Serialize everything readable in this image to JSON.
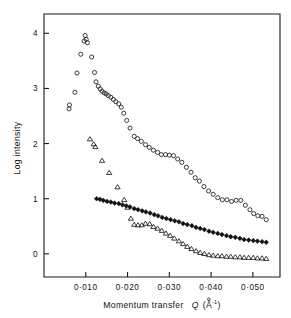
{
  "figure": {
    "background_color": "#ffffff",
    "ink_color": "#111111"
  },
  "chart_data": {
    "type": "scatter",
    "title": "",
    "subtitle": "",
    "xlabel": "Momentum transfer  Q (Å⁻¹)",
    "xlabel_main": "Momentum transfer",
    "xlabel_symbol": "Q",
    "xlabel_unit_open": "(Å",
    "xlabel_unit_exp": "-1",
    "xlabel_unit_close": ")",
    "ylabel": "Log intensity",
    "xlim": [
      0.0,
      0.0565
    ],
    "ylim": [
      -0.42,
      4.35
    ],
    "xticks": [
      0.01,
      0.02,
      0.03,
      0.04,
      0.05
    ],
    "xticklabels": [
      "0·010",
      "0·020",
      "0·030",
      "0·040",
      "0·050"
    ],
    "yticks": [
      0,
      1,
      2,
      3,
      4
    ],
    "yticklabels": [
      "0",
      "1",
      "2",
      "3",
      "4"
    ],
    "grid": false,
    "legend": "none",
    "frame": "full-box",
    "series": [
      {
        "name": "open-circles",
        "marker": "circle-open",
        "marker_size": 4.1,
        "points": [
          [
            0.006,
            2.63
          ],
          [
            0.0061,
            2.7
          ],
          [
            0.0074,
            2.93
          ],
          [
            0.0079,
            3.28
          ],
          [
            0.0088,
            3.62
          ],
          [
            0.0096,
            3.86
          ],
          [
            0.00985,
            3.96
          ],
          [
            0.0101,
            3.89
          ],
          [
            0.0104,
            3.83
          ],
          [
            0.0114,
            3.57
          ],
          [
            0.0121,
            3.29
          ],
          [
            0.01245,
            3.12
          ],
          [
            0.013,
            3.04
          ],
          [
            0.01345,
            2.99
          ],
          [
            0.0139,
            2.95
          ],
          [
            0.0144,
            2.92
          ],
          [
            0.0149,
            2.9
          ],
          [
            0.0154,
            2.87
          ],
          [
            0.016,
            2.84
          ],
          [
            0.0166,
            2.8
          ],
          [
            0.0172,
            2.76
          ],
          [
            0.0179,
            2.72
          ],
          [
            0.0185,
            2.66
          ],
          [
            0.0191,
            2.55
          ],
          [
            0.0198,
            2.42
          ],
          [
            0.0206,
            2.28
          ],
          [
            0.0216,
            2.13
          ],
          [
            0.0224,
            2.09
          ],
          [
            0.0233,
            2.04
          ],
          [
            0.0243,
            1.98
          ],
          [
            0.0252,
            1.93
          ],
          [
            0.0262,
            1.88
          ],
          [
            0.0272,
            1.84
          ],
          [
            0.0281,
            1.8
          ],
          [
            0.0291,
            1.8
          ],
          [
            0.03,
            1.79
          ],
          [
            0.031,
            1.78
          ],
          [
            0.032,
            1.72
          ],
          [
            0.033,
            1.66
          ],
          [
            0.0341,
            1.57
          ],
          [
            0.0352,
            1.48
          ],
          [
            0.0362,
            1.38
          ],
          [
            0.0372,
            1.32
          ],
          [
            0.0383,
            1.22
          ],
          [
            0.0394,
            1.14
          ],
          [
            0.0405,
            1.08
          ],
          [
            0.0416,
            1.02
          ],
          [
            0.0427,
            0.98
          ],
          [
            0.0438,
            0.98
          ],
          [
            0.0449,
            0.95
          ],
          [
            0.046,
            0.97
          ],
          [
            0.0471,
            0.97
          ],
          [
            0.0482,
            0.88
          ],
          [
            0.0493,
            0.8
          ],
          [
            0.0502,
            0.73
          ],
          [
            0.0512,
            0.69
          ],
          [
            0.0522,
            0.68
          ],
          [
            0.0532,
            0.62
          ]
        ]
      },
      {
        "name": "open-triangles",
        "marker": "triangle-open",
        "marker_size": 4.4,
        "points": [
          [
            0.011,
            2.08
          ],
          [
            0.0119,
            1.99
          ],
          [
            0.0123,
            1.94
          ],
          [
            0.0139,
            1.69
          ],
          [
            0.0156,
            1.47
          ],
          [
            0.0176,
            1.21
          ],
          [
            0.0192,
            0.98
          ],
          [
            0.02,
            0.84
          ],
          [
            0.0208,
            0.64
          ],
          [
            0.0216,
            0.53
          ],
          [
            0.0225,
            0.52
          ],
          [
            0.0234,
            0.52
          ],
          [
            0.0243,
            0.55
          ],
          [
            0.0253,
            0.54
          ],
          [
            0.0262,
            0.49
          ],
          [
            0.0272,
            0.46
          ],
          [
            0.0282,
            0.42
          ],
          [
            0.0292,
            0.37
          ],
          [
            0.0302,
            0.33
          ],
          [
            0.0312,
            0.28
          ],
          [
            0.0323,
            0.23
          ],
          [
            0.0333,
            0.18
          ],
          [
            0.0343,
            0.13
          ],
          [
            0.0353,
            0.09
          ],
          [
            0.0364,
            0.05
          ],
          [
            0.0374,
            0.02
          ],
          [
            0.0384,
            0.0
          ],
          [
            0.0395,
            -0.02
          ],
          [
            0.0405,
            -0.03
          ],
          [
            0.0416,
            -0.04
          ],
          [
            0.0426,
            -0.04
          ],
          [
            0.0437,
            -0.05
          ],
          [
            0.0447,
            -0.05
          ],
          [
            0.0458,
            -0.06
          ],
          [
            0.0469,
            -0.06
          ],
          [
            0.0479,
            -0.07
          ],
          [
            0.049,
            -0.07
          ],
          [
            0.0501,
            -0.07
          ],
          [
            0.0511,
            -0.08
          ],
          [
            0.0522,
            -0.08
          ],
          [
            0.0532,
            -0.09
          ]
        ]
      },
      {
        "name": "filled-diamonds",
        "marker": "diamond-filled",
        "marker_size": 3.6,
        "points": [
          [
            0.0126,
            1.0
          ],
          [
            0.0134,
            0.99
          ],
          [
            0.0142,
            0.97
          ],
          [
            0.0151,
            0.95
          ],
          [
            0.016,
            0.94
          ],
          [
            0.0169,
            0.92
          ],
          [
            0.0179,
            0.91
          ],
          [
            0.0188,
            0.89
          ],
          [
            0.0197,
            0.87
          ],
          [
            0.0206,
            0.85
          ],
          [
            0.0216,
            0.82
          ],
          [
            0.0225,
            0.8
          ],
          [
            0.0235,
            0.78
          ],
          [
            0.0244,
            0.76
          ],
          [
            0.0254,
            0.74
          ],
          [
            0.0264,
            0.71
          ],
          [
            0.0273,
            0.69
          ],
          [
            0.0283,
            0.66
          ],
          [
            0.0293,
            0.64
          ],
          [
            0.0303,
            0.62
          ],
          [
            0.0313,
            0.6
          ],
          [
            0.0323,
            0.58
          ],
          [
            0.0333,
            0.55
          ],
          [
            0.0343,
            0.53
          ],
          [
            0.0354,
            0.51
          ],
          [
            0.0364,
            0.48
          ],
          [
            0.0374,
            0.46
          ],
          [
            0.0384,
            0.44
          ],
          [
            0.0395,
            0.41
          ],
          [
            0.0405,
            0.39
          ],
          [
            0.0416,
            0.37
          ],
          [
            0.0426,
            0.35
          ],
          [
            0.0437,
            0.33
          ],
          [
            0.0447,
            0.31
          ],
          [
            0.0458,
            0.3
          ],
          [
            0.0469,
            0.28
          ],
          [
            0.0479,
            0.26
          ],
          [
            0.049,
            0.25
          ],
          [
            0.0501,
            0.24
          ],
          [
            0.0511,
            0.23
          ],
          [
            0.0522,
            0.22
          ],
          [
            0.0532,
            0.21
          ]
        ]
      }
    ]
  }
}
